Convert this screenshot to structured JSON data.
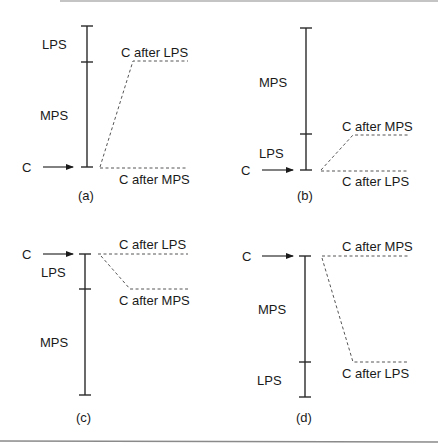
{
  "figure": {
    "colors": {
      "line": "#2a2a2a",
      "dash": "#555555",
      "text": "#1a1a1a",
      "rule": "#8a8a8a"
    },
    "panels": [
      {
        "id": "a",
        "caption": "(a)",
        "pointer_label": "C",
        "segments": [
          {
            "label": "LPS",
            "position": "top"
          },
          {
            "label": "MPS",
            "position": "bottom"
          }
        ],
        "outcomes": [
          {
            "label": "C after LPS",
            "position": "upper"
          },
          {
            "label": "C after MPS",
            "position": "lower"
          }
        ]
      },
      {
        "id": "b",
        "caption": "(b)",
        "pointer_label": "C",
        "segments": [
          {
            "label": "MPS",
            "position": "top"
          },
          {
            "label": "LPS",
            "position": "bottom"
          }
        ],
        "outcomes": [
          {
            "label": "C after MPS",
            "position": "upper"
          },
          {
            "label": "C after LPS",
            "position": "lower"
          }
        ]
      },
      {
        "id": "c",
        "caption": "(c)",
        "pointer_label": "C",
        "segments": [
          {
            "label": "LPS",
            "position": "top"
          },
          {
            "label": "MPS",
            "position": "bottom"
          }
        ],
        "outcomes": [
          {
            "label": "C after LPS",
            "position": "upper"
          },
          {
            "label": "C after MPS",
            "position": "lower"
          }
        ]
      },
      {
        "id": "d",
        "caption": "(d)",
        "pointer_label": "C",
        "segments": [
          {
            "label": "MPS",
            "position": "top"
          },
          {
            "label": "LPS",
            "position": "bottom"
          }
        ],
        "outcomes": [
          {
            "label": "C after MPS",
            "position": "upper"
          },
          {
            "label": "C after LPS",
            "position": "lower"
          }
        ]
      }
    ]
  }
}
